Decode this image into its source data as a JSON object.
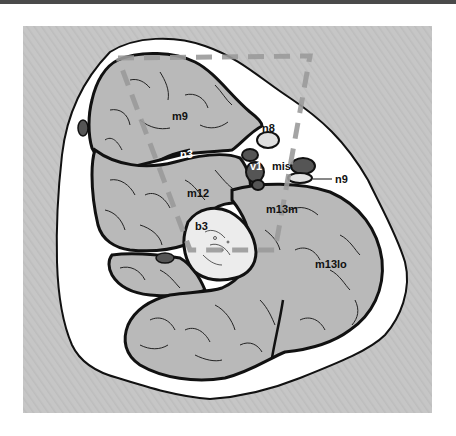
{
  "figure": {
    "type": "anatomical cross-section illustration",
    "colors": {
      "background_panel": "#c4c4c4",
      "skin_region": "#ffffff",
      "muscle_fill": "#b9b9b9",
      "outline": "#111111",
      "vessel_fill": "#555555",
      "bone_fill": "#ececec",
      "dashed_frame": "#9a9a9a",
      "top_bar": "#4a4a4a"
    },
    "labels": {
      "m9": "m9",
      "n8": "n8",
      "n3": "n3",
      "v1": "v1",
      "mis": "mis",
      "n9": "n9",
      "m12": "m12",
      "m13m": "m13m",
      "b3": "b3",
      "m13lo": "m13lo"
    }
  }
}
